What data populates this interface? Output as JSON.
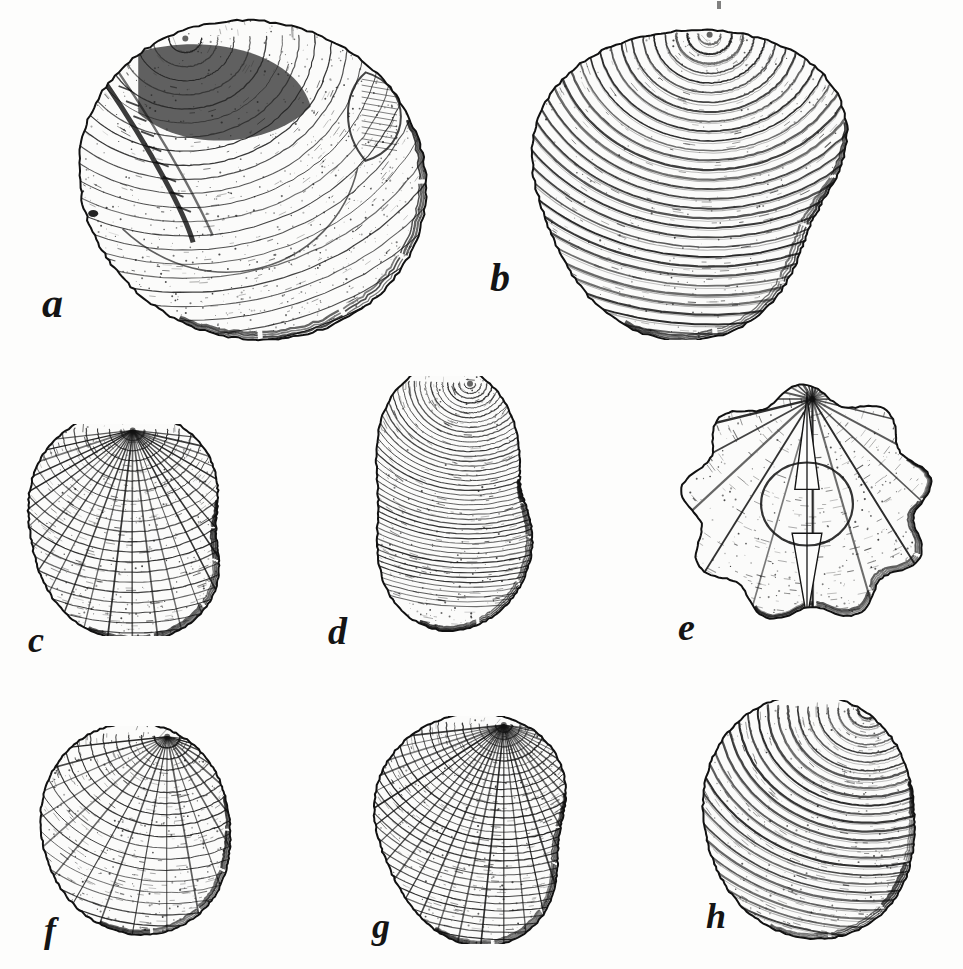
{
  "plate": {
    "kind": "scientific-illustration-plate",
    "subject": "fossil bivalve shells",
    "technique": "line engraving with stipple",
    "background_color": "#fdfdfc",
    "ink_color": "#1a1a1a",
    "width": 963,
    "height": 969,
    "caption": "",
    "plate_number": ""
  },
  "figures": [
    {
      "label": "a",
      "name": "specimen-a",
      "view": "interior of left valve",
      "description": "Rounded bivalve interior showing hinge plate, cardinal teeth, adductor muscle scar and pallial line; stippled shading across the shell floor.",
      "row": 1,
      "box": {
        "x": 52,
        "y": 18,
        "w": 392,
        "h": 340
      },
      "label_pos": {
        "x": 42,
        "y": 282
      },
      "label_size": 42,
      "shape": "orbicular",
      "ornament": "smooth-stippled",
      "shading": "dark-umbonal-cavity"
    },
    {
      "label": "b",
      "name": "specimen-b",
      "view": "exterior of right valve",
      "description": "Obliquely oval valve with strong regular concentric growth ribs radiating from a pointed dorsal umbo.",
      "row": 1,
      "box": {
        "x": 512,
        "y": 22,
        "w": 380,
        "h": 318
      },
      "label_pos": {
        "x": 490,
        "y": 258
      },
      "label_size": 40,
      "shape": "trigonal-oval",
      "ornament": "concentric-ribs",
      "rib_count": 34
    },
    {
      "label": "c",
      "name": "specimen-c",
      "view": "exterior, anterior oblique",
      "description": "Cockle-like valve with cancellate sculpture formed by intersecting radial ribs and concentric threads.",
      "row": 2,
      "box": {
        "x": 14,
        "y": 424,
        "w": 258,
        "h": 212
      },
      "label_pos": {
        "x": 28,
        "y": 622
      },
      "label_size": 36,
      "shape": "broadly-trigonal",
      "ornament": "cancellate",
      "radial_ribs": 26,
      "rib_count": 22
    },
    {
      "label": "d",
      "name": "specimen-d",
      "view": "exterior of left valve",
      "description": "Tall inflated valve, higher than long, covered with dense fine concentric lamellae and a sharp posterior carina.",
      "row": 2,
      "box": {
        "x": 348,
        "y": 376,
        "w": 244,
        "h": 258
      },
      "label_pos": {
        "x": 328,
        "y": 612
      },
      "label_size": 38,
      "shape": "high-trigonal",
      "ornament": "fine-concentric-lamellae",
      "rib_count": 46
    },
    {
      "label": "e",
      "name": "specimen-e",
      "view": "dorsal (anterior) view of conjoined valves",
      "description": "Both valves seen end-on, symmetric about the commissure, with a deeply scalloped lobed margin and radiating hatched folds.",
      "row": 2,
      "box": {
        "x": 672,
        "y": 382,
        "w": 270,
        "h": 244
      },
      "label_pos": {
        "x": 678,
        "y": 608
      },
      "label_size": 38,
      "shape": "lobed-circular",
      "ornament": "radial-folds",
      "lobes": 9
    },
    {
      "label": "f",
      "name": "specimen-f",
      "view": "exterior of right valve",
      "description": "Small rounded valve with a prominent incurved beak and fine radial striae crossed by growth lines.",
      "row": 3,
      "box": {
        "x": 28,
        "y": 726,
        "w": 232,
        "h": 214
      },
      "label_pos": {
        "x": 44,
        "y": 912
      },
      "label_size": 36,
      "shape": "suborbicular",
      "ornament": "fine-radial-striae",
      "rib_count": 18
    },
    {
      "label": "g",
      "name": "specimen-g",
      "view": "exterior of left valve",
      "description": "Obliquely rounded valve with a pointed projecting umbo and dense beaded radial sculpture.",
      "row": 3,
      "box": {
        "x": 360,
        "y": 716,
        "w": 248,
        "h": 228
      },
      "label_pos": {
        "x": 372,
        "y": 908
      },
      "label_size": 36,
      "shape": "oblique-oval",
      "ornament": "beaded-radial",
      "rib_count": 30
    },
    {
      "label": "h",
      "name": "specimen-h",
      "view": "exterior of right valve",
      "description": "Broadly rounded inflated valve with a strongly raised pointed umbo and concentric growth bands with stippled interspaces.",
      "row": 3,
      "box": {
        "x": 690,
        "y": 700,
        "w": 262,
        "h": 244
      },
      "label_pos": {
        "x": 706,
        "y": 898
      },
      "label_size": 36,
      "shape": "orbicular-inflated",
      "ornament": "concentric-bands",
      "rib_count": 26
    }
  ]
}
